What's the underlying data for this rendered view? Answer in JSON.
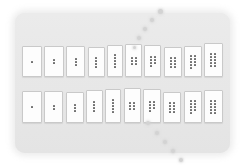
{
  "figure": {
    "title": "",
    "panel_color": "#e9e9e9",
    "card_color": "#fdfdfd",
    "card_border_color": "#c9c9c9",
    "pip_color": "#6f6f6f",
    "trail_color": "#d3d3d3"
  },
  "chart_data": {
    "type": "bar",
    "title": "",
    "xlabel": "",
    "ylabel": "",
    "categories": [
      "1",
      "2",
      "3",
      "4",
      "5",
      "6",
      "7",
      "8",
      "9",
      "10"
    ],
    "series": [
      {
        "name": "top-row",
        "values": [
          1,
          2,
          3,
          4,
          5,
          6,
          7,
          8,
          9,
          10
        ]
      },
      {
        "name": "bottom-row",
        "values": [
          1,
          2,
          3,
          4,
          5,
          6,
          7,
          8,
          9,
          10
        ]
      }
    ],
    "legend": [],
    "grid": false
  },
  "cards": {
    "top_row": [
      {
        "label": "1",
        "pips": 1,
        "cols": 1,
        "rows": 1,
        "width": 20,
        "height": 31
      },
      {
        "label": "2",
        "pips": 2,
        "cols": 1,
        "rows": 2,
        "width": 20,
        "height": 31
      },
      {
        "label": "3",
        "pips": 3,
        "cols": 1,
        "rows": 3,
        "width": 19,
        "height": 31
      },
      {
        "label": "4",
        "pips": 4,
        "cols": 1,
        "rows": 4,
        "width": 17,
        "height": 30
      },
      {
        "label": "5",
        "pips": 5,
        "cols": 1,
        "rows": 5,
        "width": 16,
        "height": 32
      },
      {
        "label": "6",
        "pips": 6,
        "cols": 2,
        "rows": 3,
        "width": 17,
        "height": 33
      },
      {
        "label": "7",
        "pips": 7,
        "cols": 2,
        "rows": 4,
        "width": 17,
        "height": 32
      },
      {
        "label": "8",
        "pips": 8,
        "cols": 2,
        "rows": 4,
        "width": 18,
        "height": 30
      },
      {
        "label": "9",
        "pips": 9,
        "cols": 2,
        "rows": 5,
        "width": 18,
        "height": 31
      },
      {
        "label": "10",
        "pips": 10,
        "cols": 2,
        "rows": 5,
        "width": 19,
        "height": 34
      }
    ],
    "bottom_row": [
      {
        "label": "1",
        "pips": 1,
        "cols": 1,
        "rows": 1,
        "width": 20,
        "height": 32
      },
      {
        "label": "2",
        "pips": 2,
        "cols": 1,
        "rows": 2,
        "width": 19,
        "height": 32
      },
      {
        "label": "3",
        "pips": 3,
        "cols": 1,
        "rows": 3,
        "width": 18,
        "height": 31
      },
      {
        "label": "4",
        "pips": 4,
        "cols": 1,
        "rows": 4,
        "width": 17,
        "height": 33
      },
      {
        "label": "5",
        "pips": 5,
        "cols": 1,
        "rows": 5,
        "width": 16,
        "height": 34
      },
      {
        "label": "6",
        "pips": 6,
        "cols": 2,
        "rows": 3,
        "width": 17,
        "height": 35
      },
      {
        "label": "7",
        "pips": 7,
        "cols": 2,
        "rows": 4,
        "width": 18,
        "height": 34
      },
      {
        "label": "8",
        "pips": 8,
        "cols": 2,
        "rows": 4,
        "width": 18,
        "height": 31
      },
      {
        "label": "9",
        "pips": 9,
        "cols": 2,
        "rows": 5,
        "width": 18,
        "height": 32
      },
      {
        "label": "10",
        "pips": 10,
        "cols": 2,
        "rows": 5,
        "width": 19,
        "height": 33
      }
    ]
  },
  "trail": {
    "name": "dotted-curve-overlay",
    "dots": [
      {
        "x": 158,
        "y": 9,
        "size": 5
      },
      {
        "x": 150,
        "y": 18,
        "size": 4
      },
      {
        "x": 143,
        "y": 27,
        "size": 4
      },
      {
        "x": 137,
        "y": 36,
        "size": 4
      },
      {
        "x": 133,
        "y": 46,
        "size": 3
      },
      {
        "x": 146,
        "y": 121,
        "size": 4
      },
      {
        "x": 155,
        "y": 131,
        "size": 4
      },
      {
        "x": 163,
        "y": 140,
        "size": 4
      },
      {
        "x": 171,
        "y": 149,
        "size": 4
      },
      {
        "x": 179,
        "y": 158,
        "size": 4
      }
    ]
  }
}
